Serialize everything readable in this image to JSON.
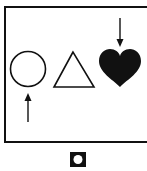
{
  "diagram": {
    "colors": {
      "stroke": "#111111",
      "fill": "#111111",
      "background": "#ffffff"
    },
    "frame": {
      "x": 5,
      "y": 7,
      "width": 150,
      "height": 135
    },
    "shapes": [
      {
        "name": "circle",
        "style": "outline",
        "cx": 28,
        "cy": 69,
        "r": 18
      },
      {
        "name": "triangle",
        "style": "outline",
        "points": "73,52 54,87 94,87"
      },
      {
        "name": "heart",
        "style": "filled",
        "cx": 120,
        "cy": 68
      }
    ],
    "arrows": [
      {
        "direction": "up",
        "x": 28,
        "y_tip": 95,
        "y_tail": 122,
        "target": "circle"
      },
      {
        "direction": "down",
        "x": 120,
        "y_tail": 18,
        "y_tip": 46,
        "target": "heart"
      }
    ],
    "answer_icon": {
      "x": 70,
      "y": 152,
      "size": 16,
      "inner": "white-circle"
    }
  }
}
